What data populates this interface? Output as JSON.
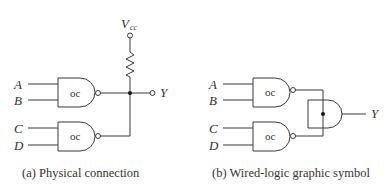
{
  "panel_a": {
    "caption": "(a) Physical connection",
    "supply": {
      "label": "V",
      "subscript": "cc"
    },
    "output": "Y",
    "gates": [
      {
        "type": "oc",
        "inputs": [
          "A",
          "B"
        ]
      },
      {
        "type": "oc",
        "inputs": [
          "C",
          "D"
        ]
      }
    ]
  },
  "panel_b": {
    "caption": "(b) Wired-logic graphic symbol",
    "output": "Y",
    "gates": [
      {
        "type": "oc",
        "inputs": [
          "A",
          "B"
        ]
      },
      {
        "type": "oc",
        "inputs": [
          "C",
          "D"
        ]
      }
    ]
  }
}
